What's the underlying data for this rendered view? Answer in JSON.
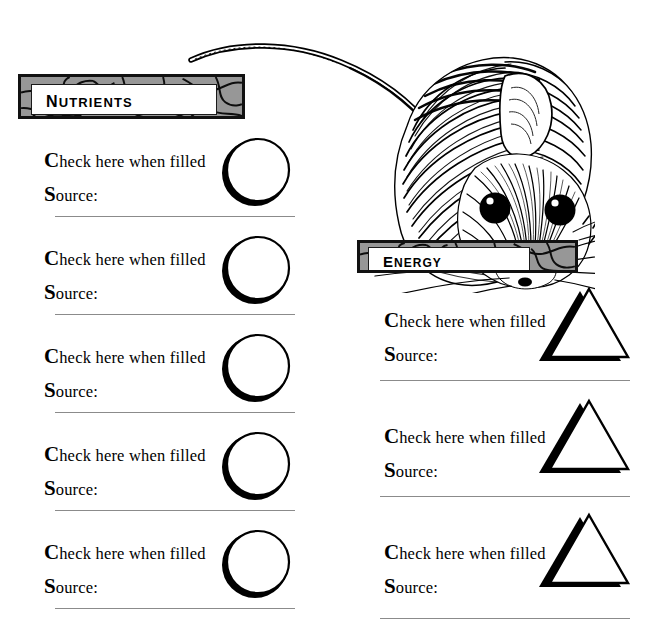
{
  "page": {
    "background_color": "#ffffff",
    "width": 671,
    "height": 643
  },
  "illustration": {
    "name": "mouse-illustration",
    "subject": "mouse",
    "style": "black-and-white pen-and-ink engraving",
    "description": "A mouse with a long curving tail arcing up to the left, large rounded ears, two round black eyes with white highlights, radiating fur hatching and fine whiskers."
  },
  "sections": [
    {
      "id": "nutrients",
      "banner": {
        "label": "Nutrients",
        "border_color": "#111111",
        "fill_color": "#979797",
        "label_box_color": "#ffffff"
      },
      "shape": "circle",
      "rows": [
        {
          "check_label": "Check here when filled",
          "source_label": "Source:",
          "source_value": ""
        },
        {
          "check_label": "Check here when filled",
          "source_label": "Source:",
          "source_value": ""
        },
        {
          "check_label": "Check here when filled",
          "source_label": "Source:",
          "source_value": ""
        },
        {
          "check_label": "Check here when filled",
          "source_label": "Source:",
          "source_value": ""
        },
        {
          "check_label": "Check here when filled",
          "source_label": "Source:",
          "source_value": ""
        }
      ]
    },
    {
      "id": "energy",
      "banner": {
        "label": "Energy",
        "border_color": "#111111",
        "fill_color": "#979797",
        "label_box_color": "#ffffff"
      },
      "shape": "triangle",
      "rows": [
        {
          "check_label": "Check here when filled",
          "source_label": "Source:",
          "source_value": ""
        },
        {
          "check_label": "Check here when filled",
          "source_label": "Source:",
          "source_value": ""
        },
        {
          "check_label": "Check here when filled",
          "source_label": "Source:",
          "source_value": ""
        }
      ]
    }
  ],
  "colors": {
    "ink": "#000000",
    "divider": "#8b8b8b",
    "mosaic_gray": "#979797",
    "paper": "#ffffff"
  }
}
